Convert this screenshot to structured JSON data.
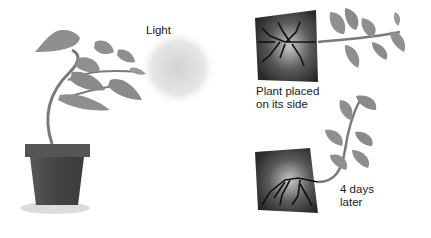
{
  "labels": {
    "light": "Light",
    "plant_on_side_line1": "Plant placed",
    "plant_on_side_line2": "on its side",
    "days_later_line1": "4 days",
    "days_later_line2": "later"
  },
  "colors": {
    "background": "#ffffff",
    "leaf": "#8f8f8f",
    "leaf_dark": "#6e6e6e",
    "stem": "#7a7a7a",
    "pot": "#4a4a4a",
    "soil": "#3a3a3a",
    "roots": "#111111",
    "light_glow": "#d6d6d6"
  }
}
